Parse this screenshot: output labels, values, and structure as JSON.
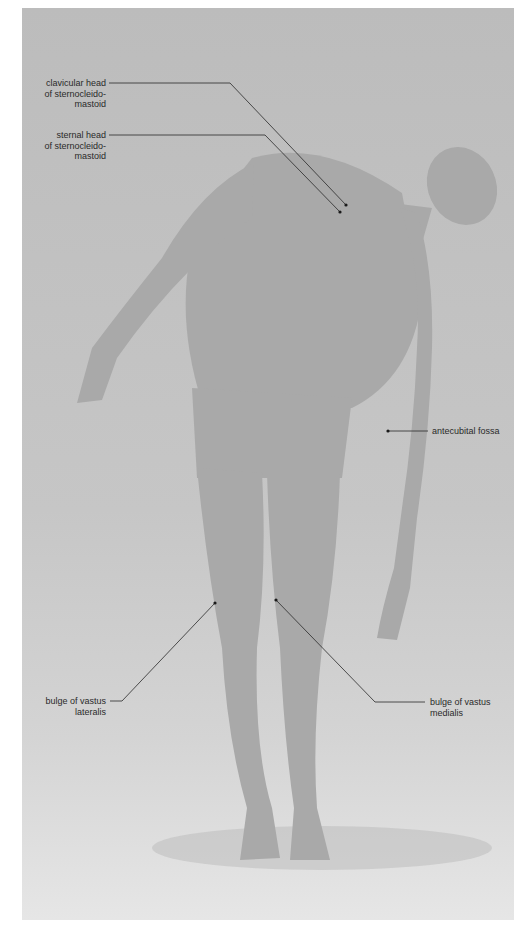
{
  "diagram": {
    "type": "surface-anatomy-photo",
    "background_color": "#c4c4c4",
    "figure_color": "#a9a9a9",
    "line_color": "#2a2a2a"
  },
  "labels": [
    {
      "id": "clavicular-head",
      "text": "clavicular head\nof sternocleido-\nmastoid",
      "side": "left"
    },
    {
      "id": "sternal-head",
      "text": "sternal head\nof sternocleido-\nmastoid",
      "side": "left"
    },
    {
      "id": "antecubital-fossa",
      "text": "antecubital fossa",
      "side": "right"
    },
    {
      "id": "vastus-lateralis",
      "text": "bulge of vastus\nlateralis",
      "side": "left"
    },
    {
      "id": "vastus-medialis",
      "text": "bulge of vastus\nmedialis",
      "side": "right"
    }
  ]
}
